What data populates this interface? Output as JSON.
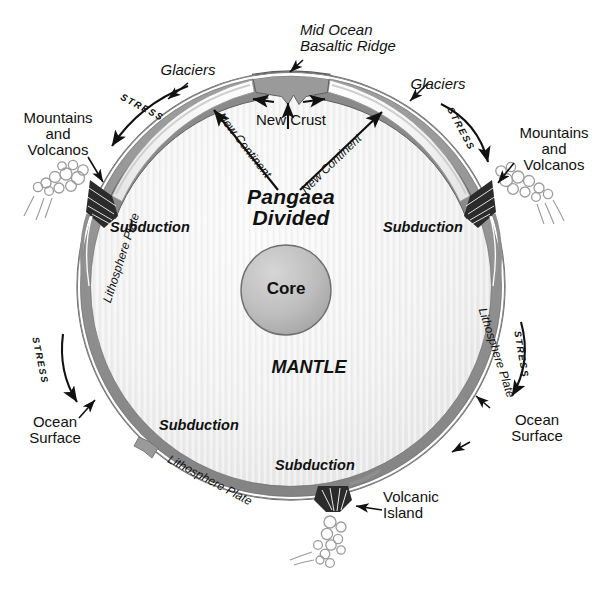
{
  "figure": {
    "kind": "geology-cross-section",
    "background_color": "#ffffff",
    "ink_color": "#111111"
  },
  "geometry": {
    "globe": {
      "cx": 291,
      "cy": 286,
      "r": 214
    },
    "core": {
      "cx": 286,
      "cy": 290,
      "r": 45
    }
  },
  "colors": {
    "mantle_light": "#f2f2f2",
    "mantle_mid": "#e6e6e6",
    "lithosphere_dark": "#8c8c8c",
    "lithosphere_mid": "#a8a8a8",
    "glacier_light": "#f7f7f7",
    "core_fill": "#b9b9b9",
    "outline": "#555555",
    "text": "#111111"
  },
  "labels": {
    "mid_ocean_ridge": "Mid Ocean\nBasaltic Ridge",
    "new_crust": "New Crust",
    "new_continent_left": "New Continent",
    "new_continent_right": "New Continent",
    "pangaea_divided": "Pangaea\nDivided",
    "glaciers_left": "Glaciers",
    "glaciers_right": "Glaciers",
    "mountains_volcanos_left": "Mountains\nand\nVolcanos",
    "mountains_volcanos_right": "Mountains\nand\nVolcanos",
    "stress_upper_left": "STRESS",
    "stress_upper_right": "STRESS",
    "stress_lower_left": "STRESS",
    "stress_lower_right": "STRESS",
    "subduction_upper_left": "Subduction",
    "subduction_upper_right": "Subduction",
    "subduction_lower_left": "Subduction",
    "subduction_lower_center": "Subduction",
    "lithosphere_plate_left": "Lithosphere Plate",
    "lithosphere_plate_right": "Lithosphere Plate",
    "lithosphere_plate_bottom": "Lithosphere Plate",
    "ocean_surface_left": "Ocean\nSurface",
    "ocean_surface_right": "Ocean\nSurface",
    "volcanic_island": "Volcanic\nIsland",
    "core": "Core",
    "mantle": "MANTLE"
  },
  "icons": {
    "spreading_arrow_left": "arrow-left-icon",
    "spreading_arrow_right": "arrow-right-icon",
    "upwelling_arrow": "arrow-up-icon",
    "ridge_pointer": "leader-arrow-icon",
    "volcano_plume": "smoke-plume-icon"
  }
}
